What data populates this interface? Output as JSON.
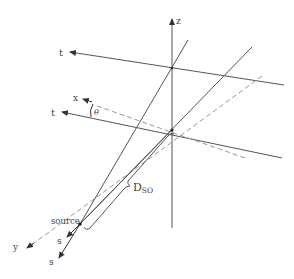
{
  "diagram": {
    "type": "3D coordinate geometry (fan-beam / cone-beam CT source geometry)",
    "labels": {
      "z_axis": "z",
      "t_upper": "t",
      "t_lower": "t",
      "x_axis": "x",
      "theta": "θ",
      "y_axis": "y",
      "source": "source",
      "s_inner": "s",
      "s_outer": "s",
      "distance_main": "D",
      "distance_sub": "SO"
    },
    "colors": {
      "line": "#555555",
      "dashed": "#999999",
      "text": "#444444"
    }
  }
}
